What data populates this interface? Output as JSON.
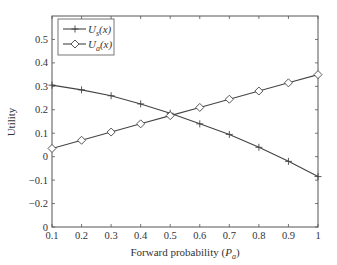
{
  "chart_data": {
    "type": "line",
    "title": "",
    "xlabel": "Forward probability (P_a)",
    "xlabel_main": "Forward probability (",
    "xlabel_var": "P",
    "xlabel_sub": "a",
    "xlabel_close": ")",
    "ylabel": "Utility",
    "xlim": [
      0.1,
      1.0
    ],
    "ylim": [
      -0.3,
      0.6
    ],
    "xticks": [
      0.1,
      0.2,
      0.3,
      0.4,
      0.5,
      0.6,
      0.7,
      0.8,
      0.9,
      1.0
    ],
    "xtick_labels": [
      "0.1",
      "0.2",
      "0.3",
      "0.4",
      "0.5",
      "0.6",
      "0.7",
      "0.8",
      "0.9",
      "1"
    ],
    "yticks": [
      -0.3,
      -0.2,
      -0.1,
      0,
      0.1,
      0.2,
      0.3,
      0.4,
      0.5
    ],
    "ytick_labels": [
      "0",
      "−0.2",
      "−0.1",
      "0",
      "0.1",
      "0.2",
      "0.3",
      "0.4",
      "0.5"
    ],
    "grid": false,
    "legend_position": "upper left",
    "x": [
      0.1,
      0.2,
      0.3,
      0.4,
      0.5,
      0.6,
      0.7,
      0.8,
      0.9,
      1.0
    ],
    "series": [
      {
        "name": "U_s(x)",
        "legend_main": "U",
        "legend_sub": "s",
        "legend_arg": "(x)",
        "marker": "plus",
        "values": [
          0.305,
          0.285,
          0.26,
          0.225,
          0.185,
          0.14,
          0.095,
          0.04,
          -0.02,
          -0.085
        ]
      },
      {
        "name": "U_a(x)",
        "legend_main": "U",
        "legend_sub": "a",
        "legend_arg": "(x)",
        "marker": "diamond",
        "values": [
          0.035,
          0.07,
          0.105,
          0.14,
          0.175,
          0.21,
          0.245,
          0.28,
          0.315,
          0.35
        ]
      }
    ],
    "colors": {
      "line": "#444444",
      "axis": "#555555",
      "text": "#333333"
    }
  }
}
